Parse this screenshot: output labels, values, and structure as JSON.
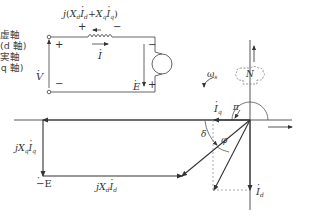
{
  "circuit": {
    "reactance_drop_label": "j(X_d İ_d + X_q İ_q)",
    "reactance_drop_parts": {
      "j": "j",
      "open": "(",
      "xd": "X",
      "xd_sub": "d",
      "id": "I",
      "id_sub": "d",
      "plus": "+",
      "xq": "X",
      "xq_sub": "q",
      "iq": "I",
      "iq_sub": "q",
      "close": ")"
    },
    "inductor_plus": "+",
    "inductor_minus": "−",
    "current_label": "I",
    "terminal_voltage_label": "V",
    "terminal_plus": "+",
    "terminal_minus": "−",
    "emf_label": "E",
    "source_minus": "−",
    "source_plus": "+"
  },
  "phasor_diagram": {
    "imag_axis_label": "虚軸",
    "imag_axis_sub": "(d 軸)",
    "real_axis_label": "実軸",
    "real_axis_sub": "(q 軸)",
    "rotation_label": "ω",
    "rotation_sub": "s",
    "rotor_pole": "N",
    "neg_emf_label": "−E",
    "jXqIq_label": {
      "j": "j",
      "x": "X",
      "x_sub": "q",
      "i": "I",
      "i_sub": "q"
    },
    "jXdId_label": {
      "j": "j",
      "x": "X",
      "x_sub": "d",
      "i": "I",
      "i_sub": "d"
    },
    "V_label": "V",
    "I_label": "I",
    "Iq_label": {
      "i": "I",
      "sub": "q"
    },
    "Id_label": {
      "i": "I",
      "sub": "d"
    },
    "pi_label": "π",
    "delta_label": "δ",
    "phi_label": "φ"
  },
  "colors": {
    "line": "#333333",
    "dashed": "#888888",
    "text": "#333333"
  }
}
